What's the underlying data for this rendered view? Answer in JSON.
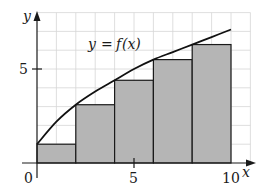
{
  "chart_data": {
    "type": "bar",
    "subtype": "riemann-sum-left-endpoint",
    "title": "",
    "curve_label": "y = f(x)",
    "xlabel": "x",
    "ylabel": "y",
    "xlim": [
      0,
      11
    ],
    "ylim": [
      0,
      8
    ],
    "x_ticks": [
      {
        "value": 0,
        "label": "0"
      },
      {
        "value": 5,
        "label": "5"
      },
      {
        "value": 10,
        "label": "10"
      }
    ],
    "y_ticks": [
      {
        "value": 5,
        "label": "5"
      }
    ],
    "grid": true,
    "grid_step": 1,
    "bars": [
      {
        "x0": 0,
        "x1": 2,
        "height": 1.0
      },
      {
        "x0": 2,
        "x1": 4,
        "height": 3.1
      },
      {
        "x0": 4,
        "x1": 6,
        "height": 4.4
      },
      {
        "x0": 6,
        "x1": 8,
        "height": 5.5
      },
      {
        "x0": 8,
        "x1": 10,
        "height": 6.3
      }
    ],
    "curve": {
      "x": [
        0,
        1,
        2,
        3,
        4,
        5,
        6,
        7,
        8,
        9,
        10
      ],
      "y": [
        1.0,
        2.2,
        3.1,
        3.8,
        4.4,
        5.0,
        5.5,
        5.9,
        6.3,
        6.7,
        7.1
      ]
    },
    "colors": {
      "bar_fill": "#b5b5b5",
      "bar_edge": "#1a1a1a",
      "curve": "#111111",
      "grid": "#d6d6d6"
    }
  },
  "labels": {
    "curve_label_y": "y",
    "curve_label_eq": "=",
    "curve_label_f": "f",
    "curve_label_x": "(x)",
    "x_axis": "x",
    "y_axis": "y",
    "origin": "0",
    "x_tick_5": "5",
    "x_tick_10": "10",
    "y_tick_5": "5"
  }
}
